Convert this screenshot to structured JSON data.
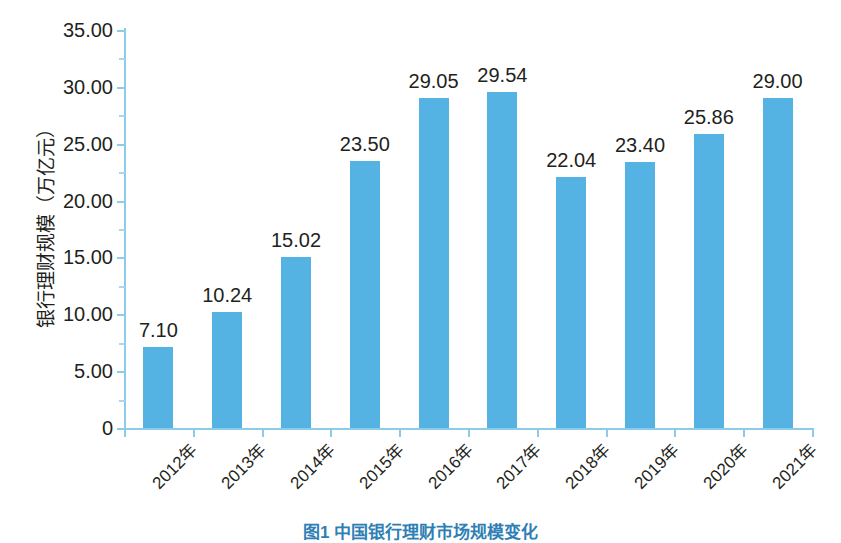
{
  "chart_data": {
    "type": "bar",
    "title": "",
    "xlabel": "",
    "ylabel": "银行理财规模（万亿元）",
    "ylim": [
      0,
      35
    ],
    "ytick_labels": [
      "0",
      "5.00",
      "10.00",
      "15.00",
      "20.00",
      "25.00",
      "30.00",
      "35.00"
    ],
    "ytick_values": [
      0,
      5,
      10,
      15,
      20,
      25,
      30,
      35
    ],
    "grid": false,
    "legend": "none",
    "categories": [
      "2012年",
      "2013年",
      "2014年",
      "2015年",
      "2016年",
      "2017年",
      "2018年",
      "2019年",
      "2020年",
      "2021年"
    ],
    "values": [
      7.1,
      10.24,
      15.02,
      23.5,
      29.05,
      29.54,
      22.04,
      23.4,
      25.86,
      29.0
    ],
    "value_labels": [
      "7.10",
      "10.24",
      "15.02",
      "23.50",
      "29.05",
      "29.54",
      "22.04",
      "23.40",
      "25.86",
      "29.00"
    ],
    "series": [
      {
        "name": "银行理财规模",
        "values": [
          7.1,
          10.24,
          15.02,
          23.5,
          29.05,
          29.54,
          22.04,
          23.4,
          25.86,
          29.0
        ]
      }
    ],
    "bar_color": "#55b3e4",
    "axis_color": "#8ecbe8",
    "text_color": "#231f20"
  },
  "caption": {
    "text": "图1  中国银行理财市场规模变化"
  }
}
